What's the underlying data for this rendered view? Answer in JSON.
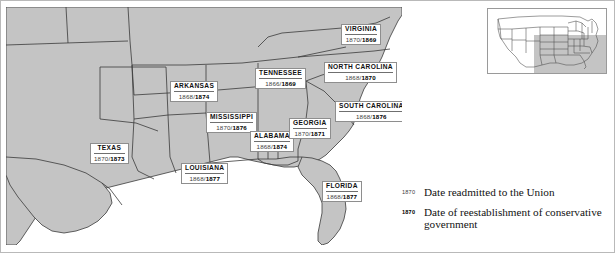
{
  "map": {
    "title": "Reconstruction of the South",
    "land_color": "#c4c4c4",
    "water_color": "#ffffff",
    "border_color": "#3a3a3a",
    "states": [
      {
        "id": "texas",
        "name": "TEXAS",
        "readmitted": "1870",
        "redeemed": "1873",
        "separator": "/"
      },
      {
        "id": "arkansas",
        "name": "ARKANSAS",
        "readmitted": "1868",
        "redeemed": "1874",
        "separator": "/"
      },
      {
        "id": "louisiana",
        "name": "LOUISIANA",
        "readmitted": "1868",
        "redeemed": "1877",
        "separator": "/"
      },
      {
        "id": "mississippi",
        "name": "MISSISSIPPI",
        "readmitted": "1870",
        "redeemed": "1876",
        "separator": "/"
      },
      {
        "id": "alabama",
        "name": "ALABAMA",
        "readmitted": "1868",
        "redeemed": "1874",
        "separator": "/"
      },
      {
        "id": "tennessee",
        "name": "TENNESSEE",
        "readmitted": "1866",
        "redeemed": "1869",
        "separator": "/"
      },
      {
        "id": "georgia",
        "name": "GEORGIA",
        "readmitted": "1870",
        "redeemed": "1871",
        "separator": "/"
      },
      {
        "id": "florida",
        "name": "FLORIDA",
        "readmitted": "1868",
        "redeemed": "1877",
        "separator": "/"
      },
      {
        "id": "south-carolina",
        "name": "SOUTH CAROLINA",
        "readmitted": "1868",
        "redeemed": "1876",
        "separator": "/"
      },
      {
        "id": "north-carolina",
        "name": "NORTH CAROLINA",
        "readmitted": "1868",
        "redeemed": "1870",
        "separator": "/"
      },
      {
        "id": "virginia",
        "name": "VIRGINIA",
        "readmitted": "1870",
        "redeemed": "1869",
        "separator": "/"
      }
    ]
  },
  "legend": {
    "items": [
      {
        "date": "1870",
        "style": "regular",
        "text": "Date readmitted to the Union"
      },
      {
        "date": "1870",
        "style": "bold",
        "text": "Date of reestablishment of conservative government"
      }
    ]
  },
  "inset": {
    "name": "united-states-locator",
    "highlight_color": "#c4c4c4"
  }
}
